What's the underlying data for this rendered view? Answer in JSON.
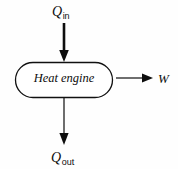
{
  "diagram": {
    "background_color": "#fefefe",
    "stroke_color": "#111111",
    "box": {
      "label": "Heat engine",
      "shape": "stadium",
      "fill": "#ffffff"
    },
    "labels": {
      "heat_in": {
        "symbol": "Q",
        "subscript": "in",
        "full": "Qin"
      },
      "heat_out": {
        "symbol": "Q",
        "subscript": "out",
        "full": "Qout"
      },
      "work": {
        "symbol": "W",
        "subscript": "",
        "full": "W"
      }
    },
    "arrows": [
      {
        "name": "heat-in-arrow",
        "direction": "down",
        "from": "top",
        "to": "engine",
        "weight": "thick"
      },
      {
        "name": "work-out-arrow",
        "direction": "right",
        "from": "engine",
        "to": "work",
        "weight": "thin"
      },
      {
        "name": "heat-out-arrow",
        "direction": "down",
        "from": "engine",
        "to": "bottom",
        "weight": "thin"
      }
    ]
  }
}
